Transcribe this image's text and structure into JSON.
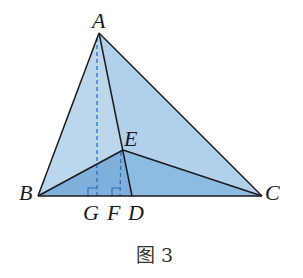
{
  "figure": {
    "caption": "图 3",
    "points": {
      "A": "A",
      "B": "B",
      "C": "C",
      "D": "D",
      "E": "E",
      "F": "F",
      "G": "G"
    },
    "colors": {
      "face_light": "#bcd6ec",
      "face_mid": "#a9cbe8",
      "face_dark": "#7fb0dc",
      "face_dark2": "#8dbbe2",
      "edge": "#1b1b1b",
      "dashed": "#2f6fb5"
    },
    "segments": [
      "AB",
      "AC",
      "BC",
      "AD",
      "BE",
      "CE"
    ],
    "dashed_segments": [
      "AG",
      "EF"
    ],
    "right_angle_marks": [
      "G",
      "F"
    ]
  }
}
